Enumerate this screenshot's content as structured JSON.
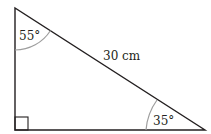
{
  "diagram": {
    "type": "right-triangle",
    "angles": {
      "top": "55°",
      "bottom_right": "35°",
      "bottom_left": "right-angle"
    },
    "sides": {
      "hypotenuse": "30 cm"
    },
    "colors": {
      "stroke": "#231f20",
      "arc": "#9e9e9e",
      "background": "#ffffff"
    }
  }
}
